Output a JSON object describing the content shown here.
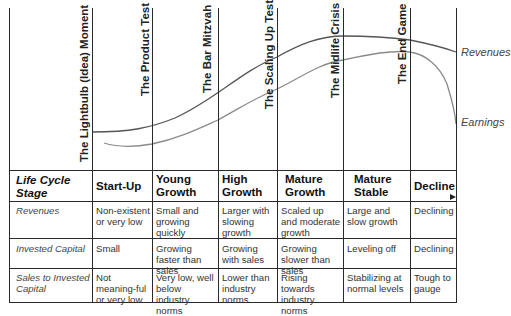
{
  "milestones": [
    {
      "label": "The Lightbulb (Idea) Moment"
    },
    {
      "label": "The Product Test"
    },
    {
      "label": "The Bar Mitzvah"
    },
    {
      "label": "The Scaling Up Test"
    },
    {
      "label": "The Midlife Crisis"
    },
    {
      "label": "The End Game"
    }
  ],
  "curves": {
    "revenues_label": "Revenues",
    "earnings_label": "Earnings",
    "revenues_color": "#555555",
    "earnings_color": "#8a8a8a"
  },
  "table": {
    "header": {
      "row_label": "Life Cycle Stage",
      "stages": [
        "Start-Up",
        "Young Growth",
        "High Growth",
        "Mature Growth",
        "Mature Stable",
        "Decline"
      ]
    },
    "rows": [
      {
        "label": "Revenues",
        "cells": [
          "Non-existent or very low",
          "Small and growing quickly",
          "Larger with slowing growth",
          "Scaled up and moderate growth",
          "Large and slow growth",
          "Declining"
        ]
      },
      {
        "label": "Invested Capital",
        "cells": [
          "Small",
          "Growing faster than sales",
          "Growing with sales",
          "Growing slower than sales",
          "Leveling off",
          "Declining"
        ]
      },
      {
        "label": "Sales to Invested Capital",
        "cells": [
          "Not meaning-ful or very low",
          "Very low, well below industry norms",
          "Lower than industry norms",
          "Rising towards industry norms",
          "Stabilizing at normal levels",
          "Tough to gauge"
        ]
      }
    ]
  }
}
